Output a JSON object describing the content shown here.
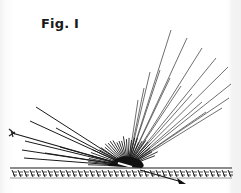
{
  "figure": {
    "title": "Fig. I",
    "ink_color": "#1a1a1a",
    "ray_color": "#4a4a4a",
    "surface": "hatched ground surface",
    "elements": {
      "incident_ray": "incoming ray with feathered tail from upper-left",
      "scattered_rays": "fan of rays radiating from impact point",
      "reflected_ray": "arrow continuing below surface to lower-right"
    }
  }
}
